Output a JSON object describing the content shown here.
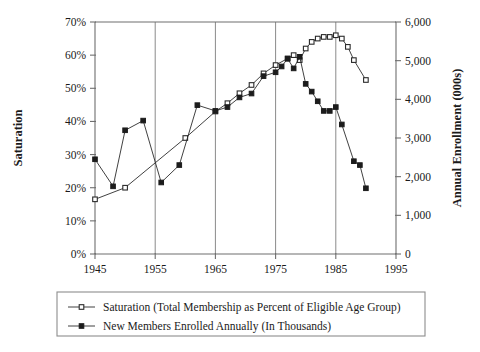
{
  "chart_data": {
    "type": "line",
    "title": "",
    "xlabel": "",
    "ylabel": "Saturation",
    "ylabel_right": "Annual Enrollment (000s)",
    "xlim": [
      1945,
      1995
    ],
    "xticks": [
      1945,
      1955,
      1965,
      1975,
      1985,
      1995
    ],
    "xticklabels": [
      "1945",
      "1955",
      "1965",
      "1975",
      "1985",
      "1995"
    ],
    "ylim": [
      0,
      70
    ],
    "yticks": [
      0,
      10,
      20,
      30,
      40,
      50,
      60,
      70
    ],
    "yticklabels": [
      "0%",
      "10%",
      "20%",
      "30%",
      "40%",
      "50%",
      "60%",
      "70%"
    ],
    "ylim_right": [
      0,
      6000
    ],
    "yticks_right": [
      0,
      1000,
      2000,
      3000,
      4000,
      5000,
      6000
    ],
    "yticklabels_right": [
      "0",
      "1,000",
      "2,000",
      "3,000",
      "4,000",
      "5,000",
      "6,000"
    ],
    "grid": "vertical-only",
    "legend_position": "below",
    "series": [
      {
        "name": "Saturation (Total Membership as Percent of Eligible Age Group)",
        "marker": "open-square",
        "axis": "left",
        "unit": "%",
        "x": [
          1945,
          1950,
          1960,
          1965,
          1967,
          1969,
          1971,
          1973,
          1975,
          1977,
          1978,
          1979,
          1980,
          1981,
          1982,
          1983,
          1984,
          1985,
          1986,
          1987,
          1988,
          1990
        ],
        "values": [
          16.5,
          20.0,
          35.0,
          43.0,
          45.5,
          48.5,
          51.0,
          54.5,
          57.0,
          59.0,
          60.0,
          58.5,
          62.0,
          64.0,
          65.0,
          65.5,
          65.5,
          66.0,
          65.0,
          62.5,
          58.5,
          52.5
        ]
      },
      {
        "name": "New Members Enrolled Annually (In Thousands)",
        "marker": "filled-square",
        "axis": "right",
        "unit": "000s",
        "x": [
          1945,
          1948,
          1950,
          1953,
          1956,
          1959,
          1962,
          1965,
          1967,
          1969,
          1971,
          1973,
          1975,
          1976,
          1977,
          1978,
          1979,
          1980,
          1981,
          1982,
          1983,
          1984,
          1985,
          1986,
          1988,
          1989,
          1990
        ],
        "values": [
          2450,
          1750,
          3200,
          3450,
          1850,
          2300,
          3850,
          3700,
          3800,
          4050,
          4150,
          4600,
          4700,
          4850,
          5050,
          4800,
          5100,
          4400,
          4200,
          3950,
          3700,
          3700,
          3800,
          3350,
          2400,
          2300,
          1700
        ]
      }
    ]
  },
  "legend": {
    "entries": [
      {
        "label": "Saturation (Total Membership as Percent of Eligible Age Group)",
        "marker": "open-square"
      },
      {
        "label": "New Members Enrolled Annually (In Thousands)",
        "marker": "filled-square"
      }
    ]
  }
}
